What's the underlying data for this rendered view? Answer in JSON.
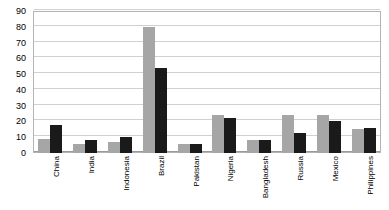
{
  "chart_data": {
    "type": "bar",
    "title": "",
    "subtitle": "",
    "xlabel": "",
    "ylabel": "",
    "ylim": [
      0,
      90
    ],
    "ytick_step": 10,
    "yticks": [
      0,
      10,
      20,
      30,
      40,
      50,
      60,
      70,
      80,
      90
    ],
    "ytick_labels": [
      "0",
      "10",
      "20",
      "30",
      "40",
      "50",
      "60",
      "70",
      "80",
      "90"
    ],
    "grid": true,
    "grid_axis": "y",
    "legend": false,
    "legend_position": "none",
    "categories": [
      "China",
      "India",
      "Indonesia",
      "Brazil",
      "Pakistan",
      "Nigeria",
      "Bangladesh",
      "Russia",
      "Mexico",
      "Philippines"
    ],
    "series": [
      {
        "name": "Series 1",
        "color": "#a6a6a6",
        "values": [
          9,
          6,
          7,
          80,
          6,
          24,
          8,
          24,
          24,
          15
        ]
      },
      {
        "name": "Series 2",
        "color": "#1a1a1a",
        "values": [
          18,
          8,
          10,
          54,
          6,
          22,
          8,
          13,
          20,
          16
        ]
      }
    ]
  },
  "style": {
    "plot_border_color": "#b3b3b3",
    "gridline_color": "#d0d0d0",
    "baseline_color": "#9a9a9a",
    "background": "#ffffff",
    "text_color": "#000000"
  }
}
